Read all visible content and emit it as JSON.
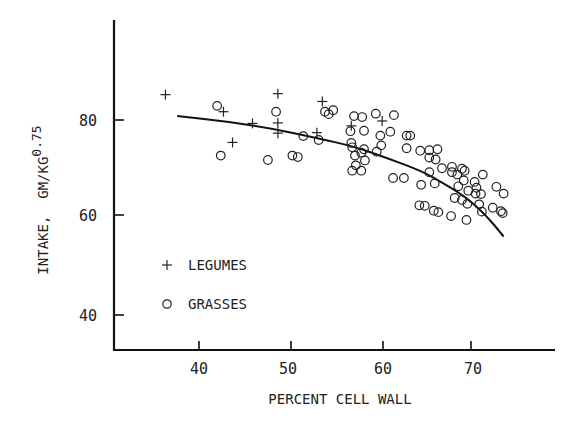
{
  "chart_data": {
    "type": "scatter",
    "title": "",
    "xlabel": "PERCENT CELL WALL",
    "ylabel": "INTAKE, GM/KG",
    "ylabel_superscript": "0.75",
    "xlim": [
      30.7,
      80
    ],
    "ylim": [
      36.4,
      90
    ],
    "xticks": [
      40,
      50,
      60,
      70
    ],
    "yticks": [
      40,
      60,
      80
    ],
    "grid": false,
    "legend": {
      "position": "lower-left",
      "entries": [
        {
          "marker": "+",
          "label": "LEGUMES"
        },
        {
          "marker": "o",
          "label": "GRASSES"
        }
      ]
    },
    "series": [
      {
        "name": "LEGUMES",
        "marker": "+",
        "points": [
          [
            36.3,
            85.2
          ],
          [
            48.7,
            85.4
          ],
          [
            42.7,
            81.7
          ],
          [
            53.6,
            83.8
          ],
          [
            45.9,
            79.3
          ],
          [
            48.7,
            79.4
          ],
          [
            48.7,
            77.3
          ],
          [
            43.7,
            75.4
          ],
          [
            53.0,
            77.4
          ],
          [
            56.8,
            78.8
          ],
          [
            60.2,
            79.8
          ]
        ]
      },
      {
        "name": "GRASSES",
        "marker": "o",
        "points": [
          [
            42.0,
            82.9
          ],
          [
            48.5,
            81.7
          ],
          [
            42.4,
            72.7
          ],
          [
            47.6,
            71.8
          ],
          [
            53.9,
            81.7
          ],
          [
            54.8,
            82.0
          ],
          [
            54.3,
            81.2
          ],
          [
            57.1,
            80.8
          ],
          [
            58.0,
            80.6
          ],
          [
            59.5,
            81.3
          ],
          [
            61.5,
            81.0
          ],
          [
            56.7,
            77.7
          ],
          [
            58.2,
            77.8
          ],
          [
            61.1,
            77.6
          ],
          [
            60.0,
            76.8
          ],
          [
            62.9,
            76.8
          ],
          [
            63.3,
            76.8
          ],
          [
            51.5,
            76.7
          ],
          [
            53.2,
            75.9
          ],
          [
            56.8,
            75.3
          ],
          [
            60.1,
            74.8
          ],
          [
            58.2,
            74.0
          ],
          [
            56.9,
            74.4
          ],
          [
            59.6,
            73.5
          ],
          [
            57.9,
            73.3
          ],
          [
            57.2,
            72.7
          ],
          [
            50.3,
            72.7
          ],
          [
            50.9,
            72.4
          ],
          [
            58.3,
            71.7
          ],
          [
            62.9,
            74.2
          ],
          [
            64.4,
            73.7
          ],
          [
            65.4,
            73.8
          ],
          [
            66.3,
            74.0
          ],
          [
            65.4,
            72.3
          ],
          [
            66.1,
            71.9
          ],
          [
            57.3,
            70.7
          ],
          [
            56.9,
            69.6
          ],
          [
            57.9,
            69.6
          ],
          [
            61.4,
            68.1
          ],
          [
            62.6,
            68.1
          ],
          [
            65.4,
            69.3
          ],
          [
            66.8,
            70.1
          ],
          [
            67.9,
            70.4
          ],
          [
            67.9,
            69.3
          ],
          [
            69.3,
            69.6
          ],
          [
            68.5,
            68.8
          ],
          [
            69.0,
            70.0
          ],
          [
            71.3,
            68.8
          ],
          [
            66.0,
            67.0
          ],
          [
            70.4,
            67.3
          ],
          [
            69.2,
            67.6
          ],
          [
            64.5,
            66.7
          ],
          [
            68.6,
            66.4
          ],
          [
            69.7,
            65.5
          ],
          [
            70.5,
            64.9
          ],
          [
            71.1,
            64.8
          ],
          [
            70.6,
            66.1
          ],
          [
            72.8,
            66.3
          ],
          [
            73.6,
            64.9
          ],
          [
            64.9,
            62.4
          ],
          [
            66.4,
            61.1
          ],
          [
            68.2,
            64.0
          ],
          [
            69.0,
            63.6
          ],
          [
            69.6,
            62.8
          ],
          [
            70.9,
            62.7
          ],
          [
            72.4,
            62.0
          ],
          [
            73.5,
            60.9
          ],
          [
            67.8,
            60.3
          ],
          [
            69.5,
            59.5
          ],
          [
            65.9,
            61.4
          ],
          [
            64.3,
            62.5
          ],
          [
            71.2,
            61.2
          ],
          [
            73.3,
            61.3
          ]
        ]
      }
    ],
    "fit_curve": {
      "type": "quadratic-decreasing",
      "points": [
        [
          37.6,
          80.8
        ],
        [
          43.0,
          79.7
        ],
        [
          48.0,
          78.3
        ],
        [
          53.0,
          76.3
        ],
        [
          57.2,
          74.5
        ],
        [
          60.6,
          72.3
        ],
        [
          64.6,
          69.5
        ],
        [
          67.0,
          67.0
        ],
        [
          69.4,
          64.2
        ],
        [
          71.6,
          60.6
        ],
        [
          73.6,
          56.1
        ]
      ]
    }
  },
  "axis": {
    "x_title": "PERCENT CELL WALL",
    "y_title_main": "INTAKE,  GM/KG",
    "y_title_sup": "0.75",
    "x_tick_labels": [
      "40",
      "50",
      "60",
      "70"
    ],
    "y_tick_labels": [
      "80",
      "60",
      "40"
    ]
  },
  "legend": {
    "legumes_symbol": "+",
    "legumes_label": "LEGUMES",
    "grasses_symbol": "o",
    "grasses_label": "GRASSES"
  }
}
